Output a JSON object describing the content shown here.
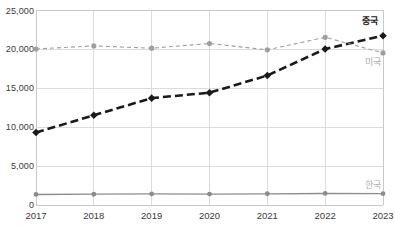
{
  "chart_data": {
    "type": "line",
    "title": "",
    "xlabel": "",
    "ylabel": "",
    "categories": [
      "2017",
      "2018",
      "2019",
      "2020",
      "2021",
      "2022",
      "2023"
    ],
    "ylim": [
      0,
      25000
    ],
    "yticks": [
      0,
      5000,
      10000,
      15000,
      20000,
      25000
    ],
    "ytick_labels": [
      "0",
      "5,000",
      "10,000",
      "15,000",
      "20,000",
      "25,000"
    ],
    "grid": true,
    "legend_position": "inline-right-end",
    "series": [
      {
        "name": "중국",
        "label": "중국",
        "color": "#1a1a1a",
        "style": "dashed",
        "marker": "diamond",
        "values": [
          9300,
          11500,
          13700,
          14400,
          16600,
          20000,
          21700
        ]
      },
      {
        "name": "미국",
        "label": "미국",
        "color": "#a0a0a0",
        "style": "dashed",
        "marker": "circle",
        "values": [
          20000,
          20400,
          20100,
          20700,
          19900,
          21500,
          19500
        ]
      },
      {
        "name": "한국",
        "label": "한국",
        "color": "#8c8c8c",
        "style": "solid",
        "marker": "circle",
        "values": [
          1350,
          1380,
          1420,
          1400,
          1440,
          1480,
          1450
        ]
      }
    ]
  }
}
